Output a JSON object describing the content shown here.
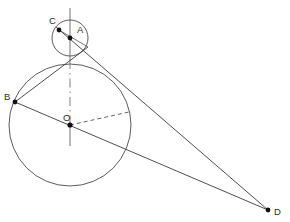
{
  "figure": {
    "canvas": {
      "width": 290,
      "height": 222,
      "background": "#ffffff"
    },
    "stroke_color": "#3a3a3a",
    "label_color": "#2b2b2b"
  },
  "points": {
    "A": {
      "label": "A",
      "x": 70,
      "y": 38,
      "label_x": 77,
      "label_y": 33
    },
    "B": {
      "label": "B",
      "x": 15,
      "y": 102,
      "label_x": 5,
      "label_y": 100
    },
    "C": {
      "label": "C",
      "x": 59,
      "y": 30,
      "label_x": 50,
      "label_y": 24
    },
    "D": {
      "label": "D",
      "x": 268,
      "y": 210,
      "label_x": 275,
      "label_y": 214
    },
    "O": {
      "label": "O",
      "x": 70,
      "y": 125,
      "label_x": 64,
      "label_y": 121
    }
  },
  "circles": {
    "small": {
      "name": "circle-A",
      "cx": 70,
      "cy": 38,
      "r": 18
    },
    "large": {
      "name": "circle-O",
      "cx": 70,
      "cy": 125,
      "r": 61
    }
  },
  "lines": {
    "axis_top": {
      "name": "vertical-axis-upper",
      "x1": 70,
      "y1": 8,
      "x2": 70,
      "y2": 62
    },
    "axis_mid": {
      "name": "vertical-axis-center",
      "x1": 70,
      "y1": 62,
      "x2": 70,
      "y2": 145
    },
    "tangent_c_d": {
      "name": "tangent-line-C-to-D",
      "x1": 56,
      "y1": 27,
      "x2": 268,
      "y2": 210
    },
    "tangent_b_upper": {
      "name": "tangent-line-B-to-small-circle",
      "x1": 15,
      "y1": 102,
      "x2": 90,
      "y2": 50
    },
    "chord_b_d": {
      "name": "line-B-through-O-to-D",
      "x1": 15,
      "y1": 102,
      "x2": 268,
      "y2": 210
    },
    "radius_dashed": {
      "name": "dashed-radius-O",
      "x1": 70,
      "y1": 125,
      "x2": 129,
      "y2": 112
    },
    "chord_c_a": {
      "name": "chord-C-to-A",
      "x1": 59,
      "y1": 30,
      "x2": 86,
      "y2": 48
    }
  }
}
